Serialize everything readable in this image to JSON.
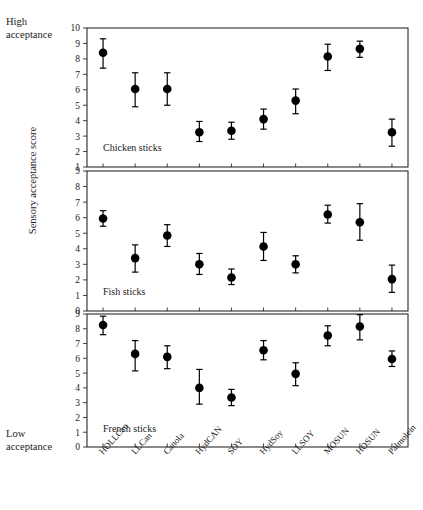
{
  "annotations": {
    "high_acceptance": "High\nacceptance",
    "high_acceptance_line1": "High",
    "high_acceptance_line2": "acceptance",
    "low_acceptance_line1": "Low",
    "low_acceptance_line2": "acceptance",
    "y_axis_title": "Sensory acceptance score"
  },
  "chart_data": {
    "type": "scatter",
    "title": "",
    "xlabel": "",
    "ylabel": "Sensory acceptance score",
    "grid": false,
    "legend": "none",
    "error_bars": "vertical",
    "marker": "filled-circle",
    "categories": [
      "HOLLCan",
      "LLCan",
      "Canola",
      "HydCAN",
      "SOY",
      "HydSoy",
      "LLSOY",
      "MOSUN",
      "HOSUN",
      "Palmolein"
    ],
    "panels": [
      {
        "name": "Chicken sticks",
        "label": "Chicken sticks",
        "ylim": [
          1,
          10
        ],
        "yticks": [
          1,
          2,
          3,
          4,
          5,
          6,
          7,
          8,
          9,
          10
        ],
        "values": [
          8.4,
          6.05,
          6.05,
          3.25,
          3.35,
          4.1,
          5.3,
          8.15,
          8.65,
          3.25
        ],
        "err_low": [
          7.4,
          4.9,
          5.0,
          2.65,
          2.8,
          3.45,
          4.45,
          7.25,
          8.1,
          2.35
        ],
        "err_high": [
          9.3,
          7.1,
          7.1,
          3.95,
          3.9,
          4.75,
          6.05,
          8.95,
          9.15,
          4.1
        ]
      },
      {
        "name": "Fish sticks",
        "label": "Fish sticks",
        "ylim": [
          0,
          9
        ],
        "yticks": [
          0,
          1,
          2,
          3,
          4,
          5,
          6,
          7,
          8,
          9
        ],
        "values": [
          5.95,
          3.4,
          4.85,
          3.0,
          2.15,
          4.15,
          3.0,
          6.2,
          5.7,
          2.05
        ],
        "err_low": [
          5.45,
          2.5,
          4.15,
          2.35,
          1.7,
          3.25,
          2.45,
          5.65,
          4.55,
          1.2
        ],
        "err_high": [
          6.45,
          4.25,
          5.55,
          3.7,
          2.7,
          5.05,
          3.55,
          6.8,
          6.9,
          2.95
        ]
      },
      {
        "name": "French sticks",
        "label": "French sticks",
        "ylim": [
          0,
          9
        ],
        "yticks": [
          0,
          1,
          2,
          3,
          4,
          5,
          6,
          7,
          8,
          9
        ],
        "values": [
          8.25,
          6.3,
          6.1,
          4.0,
          3.35,
          6.55,
          4.95,
          7.55,
          8.15,
          5.95
        ],
        "err_low": [
          7.6,
          5.15,
          5.3,
          2.9,
          2.8,
          5.9,
          4.15,
          6.85,
          7.25,
          5.45
        ],
        "err_high": [
          8.85,
          7.2,
          6.85,
          5.25,
          3.9,
          7.2,
          5.7,
          8.2,
          8.95,
          6.5
        ]
      }
    ]
  }
}
